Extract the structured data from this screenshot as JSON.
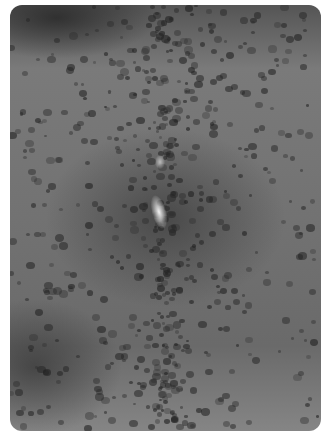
{
  "image": {
    "description": "Grayscale clinical photograph of skin (back) with numerous scattered dark papules, densest along the midline, with a bright specular highlight near center",
    "tone": "grayscale",
    "colors": {
      "background": "#ffffff",
      "skin_mid": "#727272",
      "papule": "#232323",
      "highlight": "#f2f2f2"
    }
  }
}
